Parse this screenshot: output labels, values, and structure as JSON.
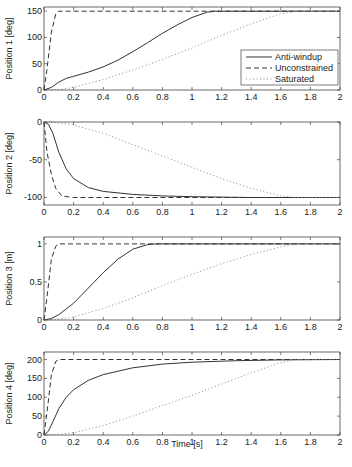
{
  "chart_data": [
    {
      "type": "line",
      "title": "",
      "xlabel": "",
      "ylabel": "Position  1 [deg]",
      "xlim": [
        0,
        2
      ],
      "ylim": [
        0,
        160
      ],
      "xticks": [
        "0",
        "0.2",
        "0.4",
        "0.6",
        "0.8",
        "1",
        "1.2",
        "1.4",
        "1.6",
        "1.8",
        "2"
      ],
      "yticks": [
        "0",
        "50",
        "100",
        "150"
      ],
      "legend": [
        "Anti-windup",
        "Unconstrained",
        "Saturated"
      ],
      "legend_position": "inside right",
      "series": [
        {
          "name": "Anti-windup",
          "style": "solid",
          "x": [
            0,
            0.05,
            0.1,
            0.15,
            0.2,
            0.3,
            0.4,
            0.5,
            0.6,
            0.7,
            0.8,
            0.9,
            1.0,
            1.1,
            1.15,
            1.2,
            2.0
          ],
          "y": [
            0,
            5,
            15,
            22,
            26,
            34,
            44,
            57,
            73,
            90,
            108,
            124,
            138,
            148,
            150,
            150,
            150
          ]
        },
        {
          "name": "Unconstrained",
          "style": "dashed",
          "x": [
            0,
            0.02,
            0.05,
            0.08,
            0.1,
            0.15,
            2.0
          ],
          "y": [
            0,
            40,
            110,
            145,
            150,
            150,
            150
          ]
        },
        {
          "name": "Saturated",
          "style": "dotted",
          "x": [
            0,
            0.1,
            0.2,
            0.4,
            0.6,
            0.8,
            1.0,
            1.2,
            1.4,
            1.6,
            1.7,
            2.0
          ],
          "y": [
            0,
            1,
            5,
            20,
            38,
            58,
            80,
            104,
            126,
            145,
            150,
            150
          ]
        }
      ]
    },
    {
      "type": "line",
      "title": "",
      "xlabel": "",
      "ylabel": "Position  2 [deg]",
      "xlim": [
        0,
        2
      ],
      "ylim": [
        -110,
        0
      ],
      "xticks": [
        "0",
        "0.2",
        "0.4",
        "0.6",
        "0.8",
        "1",
        "1.2",
        "1.4",
        "1.6",
        "1.8",
        "2"
      ],
      "yticks": [
        "-100",
        "-50",
        "0"
      ],
      "series": [
        {
          "name": "Anti-windup",
          "style": "solid",
          "x": [
            0,
            0.03,
            0.06,
            0.1,
            0.15,
            0.2,
            0.3,
            0.4,
            0.6,
            0.8,
            1.0,
            1.4,
            2.0
          ],
          "y": [
            0,
            -3,
            -15,
            -40,
            -62,
            -75,
            -87,
            -92,
            -96,
            -98,
            -99,
            -100,
            -100
          ]
        },
        {
          "name": "Unconstrained",
          "style": "dashed",
          "x": [
            0,
            0.02,
            0.05,
            0.08,
            0.12,
            0.2,
            2.0
          ],
          "y": [
            0,
            -40,
            -70,
            -88,
            -98,
            -100,
            -100
          ]
        },
        {
          "name": "Saturated",
          "style": "dotted",
          "x": [
            0,
            0.1,
            0.2,
            0.4,
            0.6,
            0.8,
            1.0,
            1.2,
            1.4,
            1.6,
            1.7,
            2.0
          ],
          "y": [
            0,
            -1,
            -4,
            -15,
            -30,
            -45,
            -60,
            -75,
            -88,
            -98,
            -100,
            -100
          ]
        }
      ]
    },
    {
      "type": "line",
      "title": "",
      "xlabel": "",
      "ylabel": "Position  3 [m]",
      "xlim": [
        0,
        2
      ],
      "ylim": [
        0,
        1.1
      ],
      "xticks": [
        "0",
        "0.2",
        "0.4",
        "0.6",
        "0.8",
        "1",
        "1.2",
        "1.4",
        "1.6",
        "1.8",
        "2"
      ],
      "yticks": [
        "0",
        "0.5",
        "1"
      ],
      "series": [
        {
          "name": "Anti-windup",
          "style": "solid",
          "x": [
            0,
            0.05,
            0.1,
            0.2,
            0.3,
            0.4,
            0.5,
            0.6,
            0.7,
            0.75,
            2.0
          ],
          "y": [
            0,
            0.02,
            0.07,
            0.22,
            0.42,
            0.62,
            0.8,
            0.93,
            0.99,
            1.0,
            1.0
          ]
        },
        {
          "name": "Unconstrained",
          "style": "dashed",
          "x": [
            0,
            0.02,
            0.05,
            0.08,
            0.1,
            2.0
          ],
          "y": [
            0,
            0.3,
            0.8,
            0.97,
            1.0,
            1.0
          ]
        },
        {
          "name": "Saturated",
          "style": "dotted",
          "x": [
            0,
            0.1,
            0.2,
            0.4,
            0.6,
            0.8,
            1.0,
            1.2,
            1.4,
            1.6,
            1.7,
            2.0
          ],
          "y": [
            0,
            0.01,
            0.04,
            0.15,
            0.29,
            0.45,
            0.6,
            0.74,
            0.86,
            0.96,
            1.0,
            1.0
          ]
        }
      ]
    },
    {
      "type": "line",
      "title": "",
      "xlabel": "Time [s]",
      "ylabel": "Position 4 [deg]",
      "xlim": [
        0,
        2
      ],
      "ylim": [
        0,
        220
      ],
      "xticks": [
        "0",
        "0.2",
        "0.4",
        "0.6",
        "0.8",
        "1",
        "1.2",
        "1.4",
        "1.6",
        "1.8",
        "2"
      ],
      "yticks": [
        "0",
        "50",
        "100",
        "150",
        "200"
      ],
      "series": [
        {
          "name": "Anti-windup",
          "style": "solid",
          "x": [
            0,
            0.03,
            0.06,
            0.1,
            0.15,
            0.2,
            0.3,
            0.4,
            0.6,
            0.8,
            1.0,
            1.3,
            1.6,
            2.0
          ],
          "y": [
            0,
            10,
            35,
            70,
            100,
            120,
            145,
            160,
            178,
            188,
            193,
            197,
            199,
            200
          ]
        },
        {
          "name": "Unconstrained",
          "style": "dashed",
          "x": [
            0,
            0.02,
            0.05,
            0.08,
            0.1,
            2.0
          ],
          "y": [
            0,
            60,
            160,
            195,
            200,
            200
          ]
        },
        {
          "name": "Saturated",
          "style": "dotted",
          "x": [
            0,
            0.1,
            0.2,
            0.4,
            0.6,
            0.8,
            1.0,
            1.2,
            1.4,
            1.6,
            1.7,
            2.0
          ],
          "y": [
            0,
            1,
            6,
            25,
            50,
            78,
            105,
            135,
            165,
            192,
            200,
            200
          ]
        }
      ]
    }
  ],
  "legend": {
    "items": [
      {
        "label": "Anti-windup",
        "style": "solid"
      },
      {
        "label": "Unconstrained",
        "style": "dashed"
      },
      {
        "label": "Saturated",
        "style": "dotted"
      }
    ]
  },
  "xlabel": "Time [s]",
  "ylabels": [
    "Position  1 [deg]",
    "Position  2 [deg]",
    "Position  3 [m]",
    "Position 4 [deg]"
  ],
  "colors": {
    "line": "#333333",
    "dotted": "#888888",
    "axis": "#444444"
  }
}
